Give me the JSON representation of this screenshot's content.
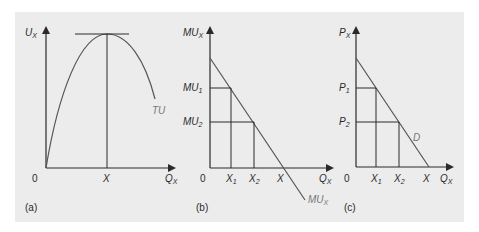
{
  "figure": {
    "panels": [
      {
        "id": "a",
        "caption": "(a)",
        "y_axis_label": "U",
        "y_axis_sub": "X",
        "x_axis_label": "Q",
        "x_axis_sub": "X",
        "origin": "0",
        "x_tick": "X",
        "curve_label": "TU"
      },
      {
        "id": "b",
        "caption": "(b)",
        "y_axis_label": "MU",
        "y_axis_sub": "X",
        "x_axis_label": "Q",
        "x_axis_sub": "X",
        "origin": "0",
        "y_ticks": [
          {
            "main": "MU",
            "sub": "1"
          },
          {
            "main": "MU",
            "sub": "2"
          }
        ],
        "x_ticks": [
          {
            "main": "X",
            "sub": "1"
          },
          {
            "main": "X",
            "sub": "2"
          },
          {
            "main": "X",
            "sub": ""
          }
        ],
        "curve_label": "MU",
        "curve_sub": "X"
      },
      {
        "id": "c",
        "caption": "(c)",
        "y_axis_label": "P",
        "y_axis_sub": "X",
        "x_axis_label": "Q",
        "x_axis_sub": "X",
        "origin": "0",
        "y_ticks": [
          {
            "main": "P",
            "sub": "1"
          },
          {
            "main": "P",
            "sub": "2"
          }
        ],
        "x_ticks": [
          {
            "main": "X",
            "sub": "1"
          },
          {
            "main": "X",
            "sub": "2"
          },
          {
            "main": "X",
            "sub": ""
          }
        ],
        "curve_label": "D"
      }
    ],
    "colors": {
      "background": "#ececec",
      "line": "#3a3a3a",
      "curve": "#555555",
      "curve_label": "#777777"
    }
  }
}
